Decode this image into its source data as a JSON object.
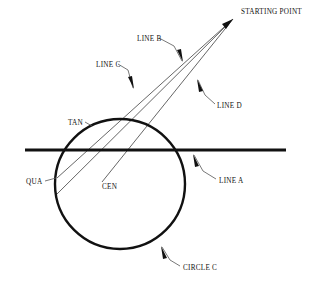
{
  "diagram": {
    "background_color": "#ffffff",
    "ink_color": "#111111",
    "thin_line_color": "#555555",
    "labels": {
      "starting_point": "STARTING POINT",
      "line_a": "LINE A",
      "line_b": "LINE B",
      "line_c": "LINE C",
      "line_d": "LINE D",
      "circle_c": "CIRCLE C",
      "tan": "TAN",
      "qua": "QUA",
      "cen": "CEN"
    },
    "geometry": {
      "starting_point": {
        "x": 233,
        "y": 19
      },
      "circle": {
        "cx": 120,
        "cy": 184,
        "r": 65,
        "stroke_width": 2.4
      },
      "horizontal_line": {
        "x1": 25,
        "y1": 150,
        "x2": 286,
        "y2": 150,
        "stroke_width": 3.0
      },
      "tangent_point": {
        "x": 90,
        "y": 126
      },
      "quadrant_point": {
        "x": 57,
        "y": 178
      },
      "center_point": {
        "x": 120,
        "y": 184
      },
      "rays": [
        {
          "name": "line-c-ray",
          "x1": 233,
          "y1": 19,
          "x2": 55,
          "y2": 196
        },
        {
          "name": "line-b-ray",
          "x1": 233,
          "y1": 19,
          "x2": 57,
          "y2": 178
        },
        {
          "name": "line-d-ray",
          "x1": 233,
          "y1": 19,
          "x2": 102,
          "y2": 182
        }
      ],
      "leaders": [
        {
          "name": "line-b-leader",
          "x1": 159,
          "y1": 38,
          "x2": 174,
          "y2": 46,
          "tipx": 183,
          "tipy": 62,
          "angle": 62
        },
        {
          "name": "line-c-leader",
          "x1": 118,
          "y1": 64,
          "x2": 128,
          "y2": 70,
          "tipx": 134,
          "tipy": 89,
          "angle": 64
        },
        {
          "name": "line-d-leader",
          "x1": 215,
          "y1": 104,
          "x2": 205,
          "y2": 95,
          "tipx": 197,
          "tipy": 79,
          "angle": 242
        },
        {
          "name": "line-a-leader",
          "x1": 216,
          "y1": 179,
          "x2": 203,
          "y2": 171,
          "tipx": 193,
          "tipy": 154,
          "angle": 240
        },
        {
          "name": "circle-c-leader",
          "x1": 180,
          "y1": 266,
          "x2": 170,
          "y2": 260,
          "tipx": 161,
          "tipy": 246,
          "angle": 238
        },
        {
          "name": "qua-leader",
          "x1": 48,
          "y1": 180,
          "x2": 56,
          "y2": 178
        },
        {
          "name": "tan-leader",
          "x1": 86,
          "y1": 122,
          "x2": 92,
          "y2": 125
        }
      ],
      "label_positions": {
        "starting_point": {
          "x": 241,
          "y": 14
        },
        "line_b": {
          "x": 137,
          "y": 41
        },
        "line_c": {
          "x": 96,
          "y": 67
        },
        "line_d": {
          "x": 217,
          "y": 108
        },
        "line_a": {
          "x": 219,
          "y": 183
        },
        "circle_c": {
          "x": 183,
          "y": 270
        },
        "tan": {
          "x": 69,
          "y": 125
        },
        "qua": {
          "x": 28,
          "y": 184
        },
        "cen": {
          "x": 103,
          "y": 189
        }
      }
    }
  }
}
